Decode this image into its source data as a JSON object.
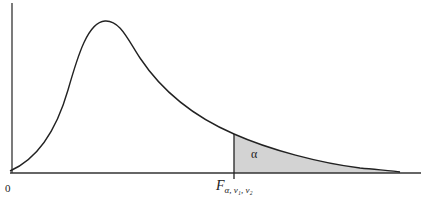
{
  "figure": {
    "origin_label": "0",
    "critical_value_label": {
      "main": "F",
      "subscript": "α, ν₁, ν₂"
    },
    "shaded_area_label": "α"
  },
  "colors": {
    "curve": "#222222",
    "axis": "#333333",
    "shade": "#d3d3d3",
    "background": "#ffffff"
  }
}
